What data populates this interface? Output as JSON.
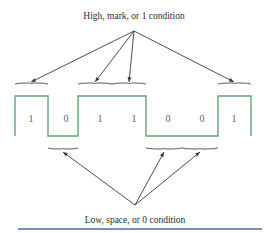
{
  "figure": {
    "title_top": "High, mark, or 1 condition",
    "title_bottom": "Low, space, or 0 condition",
    "colors": {
      "waveform": "#5fa876",
      "text": "#2b2b2b",
      "bit_text": "#5a5a6e",
      "brace": "#4a4a4a",
      "arrow": "#3a3a3a",
      "rule": "#4a6fa5",
      "background": "#ffffff"
    }
  },
  "chart_data": {
    "type": "line",
    "xlabel": "",
    "ylabel": "",
    "bits": [
      "1",
      "0",
      "1",
      "1",
      "0",
      "0",
      "1"
    ],
    "levels": [
      1,
      0,
      1,
      1,
      0,
      0,
      1
    ],
    "bit_label_x": [
      31,
      66,
      100,
      134,
      168,
      202,
      234
    ],
    "bit_label_y": 120,
    "high_y": 96,
    "low_y": 136,
    "segment_bounds": [
      [
        15,
        48
      ],
      [
        48,
        78
      ],
      [
        78,
        112
      ],
      [
        112,
        146
      ],
      [
        146,
        182
      ],
      [
        182,
        218
      ],
      [
        218,
        251
      ]
    ],
    "wave_points": "15,136 15,96 48,96 48,136 78,136 78,96 146,96 146,136 218,136 218,96 251,96 251,136",
    "ylim": [
      0,
      1
    ],
    "grid": false,
    "legend": "none"
  },
  "annotations": {
    "top_apex": {
      "x": 134,
      "y": 31
    },
    "bottom_apex": {
      "x": 135,
      "y": 205
    },
    "top_label_pos": {
      "x": 134,
      "y": 17
    },
    "bottom_label_pos": {
      "x": 135,
      "y": 221
    },
    "upper_braces": [
      {
        "x1": 15,
        "x2": 48,
        "y": 88,
        "center": 31
      },
      {
        "x1": 78,
        "x2": 112,
        "y": 88,
        "center": 95
      },
      {
        "x1": 112,
        "x2": 146,
        "y": 88,
        "center": 129
      },
      {
        "x1": 218,
        "x2": 251,
        "y": 88,
        "center": 234
      }
    ],
    "lower_braces": [
      {
        "x1": 48,
        "x2": 78,
        "y": 144,
        "center": 63
      },
      {
        "x1": 146,
        "x2": 182,
        "y": 144,
        "center": 164
      },
      {
        "x1": 182,
        "x2": 218,
        "y": 144,
        "center": 200
      }
    ],
    "upper_arrow_targets": [
      {
        "x": 31,
        "y": 82
      },
      {
        "x": 95,
        "y": 82
      },
      {
        "x": 129,
        "y": 82
      },
      {
        "x": 234,
        "y": 82
      }
    ],
    "lower_arrow_targets": [
      {
        "x": 63,
        "y": 152
      },
      {
        "x": 164,
        "y": 152
      },
      {
        "x": 200,
        "y": 152
      }
    ]
  },
  "footer_rule": {
    "x1": 18,
    "x2": 262,
    "y": 229
  }
}
